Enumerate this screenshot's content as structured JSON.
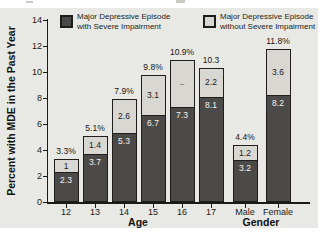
{
  "legend": [
    {
      "label": "Major Depressive Episode with Severe Impairment",
      "line1": "Major Depressive Episode",
      "line2": "with Severe Impairment",
      "color": "#4c4a48"
    },
    {
      "label": "Major Depressive Episode without Severe Impairment",
      "line1": "Major Depressive Episode",
      "line2": "without Severe Impairment",
      "color": "#d8d7d2"
    }
  ],
  "chart_data": {
    "type": "bar",
    "stacked": true,
    "title": "",
    "ylabel": "Percent with MDE in the Past Year",
    "xlabel": "",
    "ylim": [
      0,
      14
    ],
    "yticks": [
      0,
      2,
      4,
      6,
      8,
      10,
      12,
      14
    ],
    "grid": false,
    "legend_position": "top",
    "categories": [
      "12",
      "13",
      "14",
      "15",
      "16",
      "17",
      "Male",
      "Female"
    ],
    "groups": [
      {
        "label": "Age",
        "categories": [
          "12",
          "13",
          "14",
          "15",
          "16",
          "17"
        ]
      },
      {
        "label": "Gender",
        "categories": [
          "Male",
          "Female"
        ]
      }
    ],
    "series": [
      {
        "name": "Major Depressive Episode with Severe Impairment",
        "color": "#4c4a48",
        "values": [
          2.3,
          3.7,
          5.3,
          6.7,
          7.3,
          8.1,
          3.2,
          8.2
        ],
        "labels": [
          "2.3",
          "3.7",
          "5.3",
          "6.7",
          "7.3",
          "8.1",
          "3.2",
          "8.2"
        ]
      },
      {
        "name": "Major Depressive Episode without Severe Impairment",
        "color": "#d8d7d2",
        "values": [
          1.0,
          1.4,
          2.6,
          3.1,
          3.6,
          2.2,
          1.2,
          3.6
        ],
        "labels": [
          "1",
          "1.4",
          "2.6",
          "3.1",
          "–",
          "2.2",
          "1.2",
          "3.6"
        ]
      }
    ],
    "total_labels": [
      "3.3%",
      "5.1%",
      "7.9%",
      "9.8%",
      "10.9%",
      "10.3",
      "4.4%",
      "11.8%"
    ]
  }
}
